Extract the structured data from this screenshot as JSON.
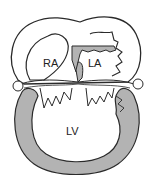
{
  "diagram": {
    "labels": {
      "ra": "RA",
      "la": "LA",
      "lv": "LV"
    },
    "colors": {
      "outline": "#2a2a2a",
      "muscle": "#b3b3b3",
      "background": "#ffffff"
    }
  }
}
